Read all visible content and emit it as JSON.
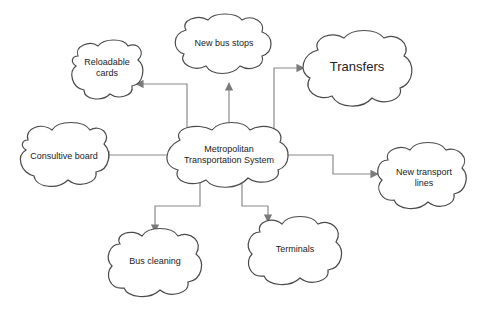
{
  "diagram": {
    "type": "mind-map",
    "colors": {
      "cloud_stroke": "#4a4a4a",
      "connector": "#8a8a8a",
      "background": "#ffffff"
    },
    "center": {
      "label_line1": "Metropolitan",
      "label_line2": "Transportation System"
    },
    "nodes": [
      {
        "id": "reloadable-cards",
        "line1": "Reloadable",
        "line2": "cards"
      },
      {
        "id": "new-bus-stops",
        "line1": "New bus stops"
      },
      {
        "id": "transfers",
        "line1": "Transfers"
      },
      {
        "id": "consultive-board",
        "line1": "Consultive board"
      },
      {
        "id": "new-transport-lines",
        "line1": "New transport",
        "line2": "lines"
      },
      {
        "id": "bus-cleaning",
        "line1": "Bus cleaning"
      },
      {
        "id": "terminals",
        "line1": "Terminals"
      }
    ],
    "edges": [
      {
        "from": "center",
        "to": "reloadable-cards"
      },
      {
        "from": "center",
        "to": "new-bus-stops"
      },
      {
        "from": "center",
        "to": "transfers"
      },
      {
        "from": "center",
        "to": "consultive-board"
      },
      {
        "from": "center",
        "to": "new-transport-lines"
      },
      {
        "from": "center",
        "to": "bus-cleaning"
      },
      {
        "from": "center",
        "to": "terminals"
      }
    ]
  }
}
